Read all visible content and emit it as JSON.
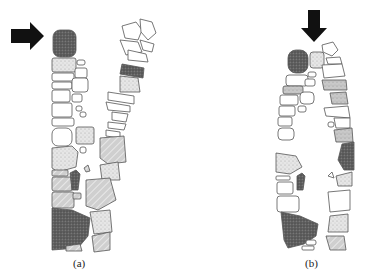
{
  "figure": {
    "panels": [
      {
        "id": "a",
        "label": "(a)",
        "description": "V-shaped leaning stone wall under lateral load",
        "load_direction": "right"
      },
      {
        "id": "b",
        "label": "(b)",
        "description": "Double-leaf stone wall under vertical load",
        "load_direction": "down"
      }
    ],
    "colors": {
      "stone_outline": "#555555",
      "stone_white": "#ffffff",
      "stone_light": "#e4e4e4",
      "stone_mid": "#c4c4c4",
      "stone_dark": "#5a5a5a",
      "arrow": "#111111"
    }
  }
}
